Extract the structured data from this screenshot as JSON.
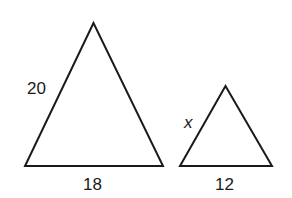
{
  "figure": {
    "background": "#ffffff",
    "stroke_color": "#1a1a1a",
    "triangles": [
      {
        "name": "large-triangle",
        "points": [
          [
            93.5,
            23
          ],
          [
            25,
            166
          ],
          [
            163,
            166
          ]
        ],
        "labels": {
          "left_side": "20",
          "base": "18"
        }
      },
      {
        "name": "small-triangle",
        "points": [
          [
            225.5,
            86
          ],
          [
            180,
            166
          ],
          [
            272,
            166
          ]
        ],
        "labels": {
          "left_side": "x",
          "base": "12"
        }
      }
    ]
  }
}
